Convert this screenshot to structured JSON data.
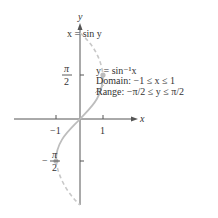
{
  "figure": {
    "axis_x_label": "x",
    "axis_y_label": "y",
    "tick_x_neg1": "−1",
    "tick_x_pos1": "1",
    "tick_y_pi_num": "π",
    "tick_y_den": "2",
    "tick_y_neg_sign": "−",
    "curve_dashed_label": "x = sin y",
    "curve_solid_label": "y = sin⁻¹x",
    "domain_text": "Domain:   −1 ≤ x ≤ 1",
    "range_text": "Range: −π/2 ≤ y ≤ π/2",
    "colors": {
      "axis": "#555555",
      "curve": "#bdbdbd",
      "text": "#333333"
    }
  }
}
